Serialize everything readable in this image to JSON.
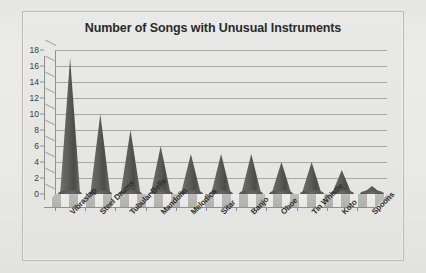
{
  "chart_data": {
    "type": "bar",
    "title": "Number of Songs with Unusual Instruments",
    "xlabel": "",
    "ylabel": "",
    "ylim": [
      0,
      18
    ],
    "ytick_step": 2,
    "yticks": [
      18,
      16,
      14,
      12,
      10,
      8,
      6,
      4,
      2,
      0
    ],
    "grid": true,
    "legend": false,
    "style": "3d-cone",
    "categories": [
      "Vibraslap",
      "Steel Drums",
      "Tubular Bells",
      "Mandolin",
      "Melodica",
      "Sitar",
      "Banjo",
      "Oboe",
      "Tin Whistle",
      "Koto",
      "Spoons"
    ],
    "values": [
      17,
      10,
      8,
      6,
      5,
      5,
      5,
      4,
      4,
      3,
      1
    ],
    "colors": {
      "bar": "#5b5b59",
      "plot_background": "#e7e7e4",
      "frame_border": "#b9b9b6",
      "gridline": "#a8a8a5",
      "axis": "#8f8f8c",
      "text": "#2b2b2b",
      "page_background": "#eeeeec"
    }
  }
}
